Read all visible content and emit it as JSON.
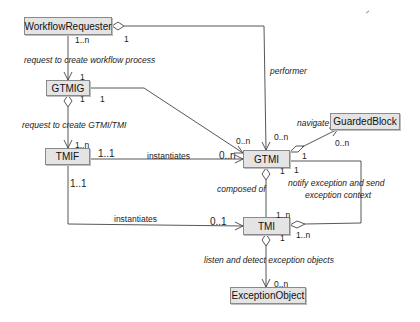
{
  "classes": {
    "workflow_requester": "WorkflowRequester",
    "gtmig": "GTMIG",
    "tmif": "TMIF",
    "gtmi": "GTMI",
    "guarded_block": "GuardedBlock",
    "tmi": "TMI",
    "exception_object": "ExceptionObject"
  },
  "associations": {
    "request_workflow": "request to create workflow process",
    "request_gtmi_tmi": "request to create GTMI/TMI",
    "performer": "performer",
    "navigate": "navigate",
    "instantiates_gtmi": "instantiates",
    "instantiates_tmi": "instantiates",
    "composed_of": "composed of",
    "notify_line1": "notify exception and send",
    "notify_line2": "exception context",
    "listen": "listen and detect exception objects"
  },
  "multiplicities": {
    "wr_to_gtmig_src": "1..n",
    "wr_performer_src": "1",
    "gtmig_from_wr": "1",
    "gtmig_down": "1",
    "gtmig_right": "1",
    "tmif_from_gtmig": "1..n",
    "tmif_right": "1..1",
    "tmif_down": "1..1",
    "gtmi_from_gtmig": "0..n",
    "gtmi_from_wr": "0..n",
    "gtmi_from_tmif": "0..n",
    "gtmi_guarded_src": "1",
    "guarded_block_target": "0..n",
    "gtmi_bottom": "1",
    "gtmi_notify": "1",
    "tmi_from_tmif": "0..1",
    "tmi_top": "1..n",
    "tmi_notify": "1..n",
    "tmi_bottom": "1",
    "exception_object_target": "0..n"
  }
}
